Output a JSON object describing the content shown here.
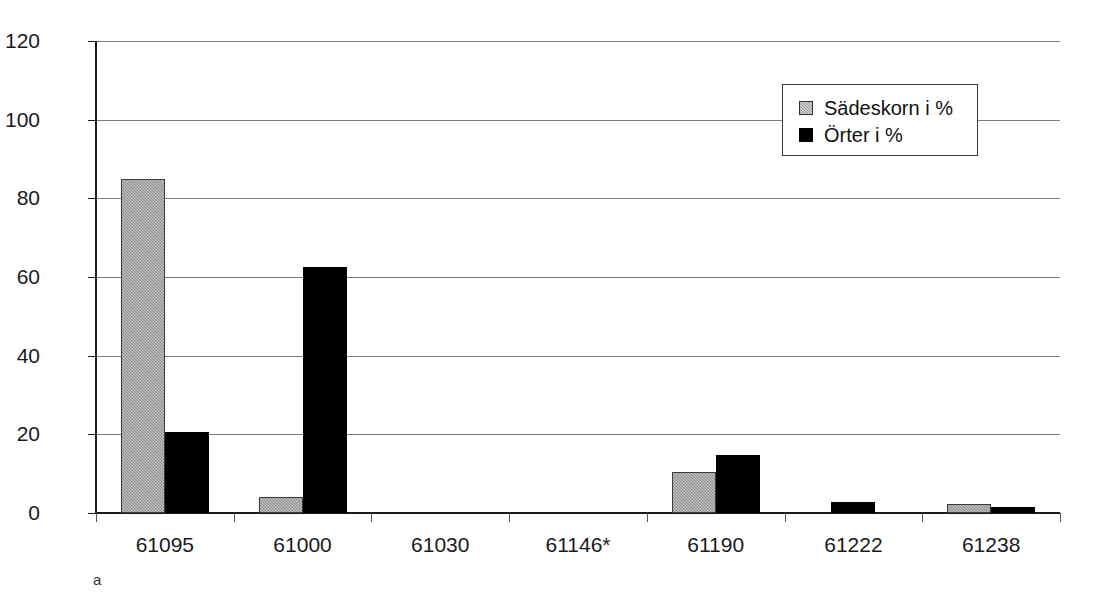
{
  "chart_data": {
    "type": "bar",
    "title": "",
    "subtitle": "",
    "xlabel": "",
    "ylabel": "",
    "ylim": [
      0,
      120
    ],
    "yticks": [
      0,
      20,
      40,
      60,
      80,
      100,
      120
    ],
    "grid": true,
    "grid_axis": "y",
    "legend_position": "top-right",
    "panel_label": "a",
    "categories": [
      "61095",
      "61000",
      "61030",
      "61146*",
      "61190",
      "61222",
      "61238"
    ],
    "series": [
      {
        "name": "Sädeskorn i %",
        "color": "#9a9a9a",
        "pattern": "dithered-gray",
        "values": [
          85,
          4,
          0,
          0,
          10.5,
          0,
          2.3
        ]
      },
      {
        "name": "Örter i %",
        "color": "#000000",
        "pattern": "solid-black",
        "values": [
          20.5,
          62.5,
          0,
          0,
          14.7,
          2.8,
          1.5
        ]
      }
    ]
  },
  "legend": {
    "entries": [
      {
        "label": "Sädeskorn i %",
        "swatch": "gray-hatched-swatch"
      },
      {
        "label": "Örter i %",
        "swatch": "black-swatch"
      }
    ]
  },
  "axes": {
    "y": {
      "tick_labels": [
        "120",
        "100",
        "80",
        "60",
        "40",
        "20",
        "0"
      ],
      "min": "0",
      "max": "120"
    },
    "x": {
      "tick_labels": [
        "61095",
        "61000",
        "61030",
        "61146*",
        "61190",
        "61222",
        "61238"
      ]
    }
  },
  "figure": {
    "panel_label": "a"
  }
}
